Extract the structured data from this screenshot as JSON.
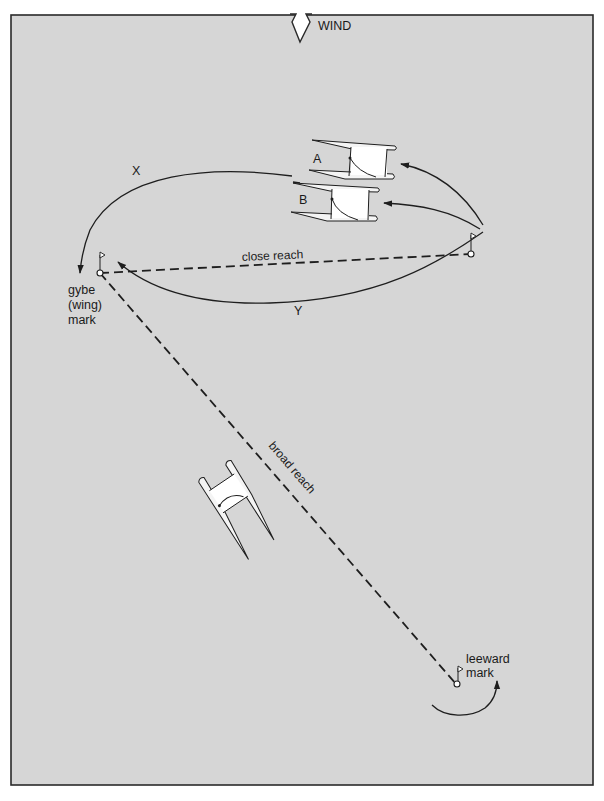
{
  "diagram": {
    "type": "sailing-course-tactics",
    "wind": {
      "label": "WIND",
      "direction": "down"
    },
    "colors": {
      "background": "#d6d6d6",
      "frame": "#2a2a2a",
      "ink": "#1e1e1e",
      "boat_fill": "#f4f4f4"
    },
    "marks": {
      "gybe": {
        "label_lines": [
          "gybe",
          "(wing)",
          "mark"
        ]
      },
      "windward_reach": {
        "label": ""
      },
      "leeward": {
        "label_lines": [
          "leeward",
          "mark"
        ]
      }
    },
    "legs": {
      "close_reach": "close reach",
      "broad_reach": "broad reach"
    },
    "paths": {
      "x": "X",
      "y": "Y"
    },
    "boats": {
      "a": "A",
      "b": "B"
    }
  }
}
